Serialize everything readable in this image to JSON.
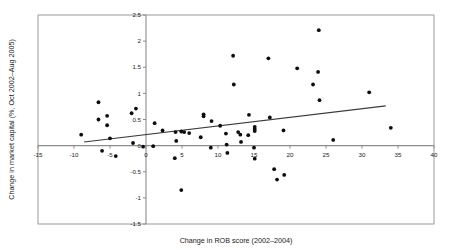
{
  "chart_data": {
    "type": "scatter",
    "title": "",
    "xlabel": "Change in ROB score (2002–2004)",
    "ylabel": "Change in market capital (%, Oct 2002–Aug 2005)",
    "xlim": [
      -15,
      40
    ],
    "ylim": [
      -1.5,
      2.5
    ],
    "xticks": [
      -15,
      -10,
      -5,
      0,
      5,
      10,
      15,
      20,
      25,
      30,
      35,
      40
    ],
    "xtick_labels": [
      "-15",
      "-10",
      "-5",
      "0",
      "5",
      "10",
      "15",
      "20",
      "25",
      "30",
      "35",
      "40"
    ],
    "yticks": [
      -1.5,
      -1,
      -0.5,
      0,
      0.5,
      1,
      1.5,
      2,
      2.5
    ],
    "ytick_labels": [
      "-1.5",
      "-1",
      "-0.5",
      "0",
      "0.5",
      "1",
      "1.5",
      "2",
      "2.5"
    ],
    "grid": false,
    "legend": null,
    "zero_lines": {
      "x": 0,
      "y": 0
    },
    "points": [
      [
        -9.0,
        0.21
      ],
      [
        -6.6,
        0.83
      ],
      [
        -6.6,
        0.5
      ],
      [
        -5.4,
        0.57
      ],
      [
        -5.4,
        0.39
      ],
      [
        -5.0,
        0.14
      ],
      [
        -6.1,
        -0.1
      ],
      [
        -4.2,
        -0.2
      ],
      [
        -2.0,
        0.62
      ],
      [
        -1.4,
        0.71
      ],
      [
        -1.8,
        0.05
      ],
      [
        -0.4,
        -0.02
      ],
      [
        1.2,
        0.43
      ],
      [
        1.0,
        -0.01
      ],
      [
        2.3,
        0.29
      ],
      [
        4.2,
        0.09
      ],
      [
        4.1,
        0.26
      ],
      [
        4.0,
        -0.24
      ],
      [
        4.9,
        0.27
      ],
      [
        5.3,
        0.26
      ],
      [
        4.9,
        -0.85
      ],
      [
        6.0,
        0.24
      ],
      [
        7.6,
        0.16
      ],
      [
        8.0,
        0.6
      ],
      [
        8.0,
        0.56
      ],
      [
        9.1,
        0.47
      ],
      [
        9.0,
        -0.04
      ],
      [
        10.3,
        0.38
      ],
      [
        11.1,
        0.23
      ],
      [
        11.2,
        0.02
      ],
      [
        11.3,
        -0.14
      ],
      [
        12.1,
        1.72
      ],
      [
        12.2,
        1.17
      ],
      [
        12.8,
        0.26
      ],
      [
        13.1,
        0.21
      ],
      [
        13.2,
        0.07
      ],
      [
        14.2,
        0.2
      ],
      [
        14.3,
        0.59
      ],
      [
        15.1,
        0.36
      ],
      [
        15.1,
        0.32
      ],
      [
        15.1,
        0.28
      ],
      [
        15.0,
        -0.04
      ],
      [
        15.1,
        -0.25
      ],
      [
        17.0,
        1.67
      ],
      [
        17.2,
        0.54
      ],
      [
        17.8,
        -0.45
      ],
      [
        18.2,
        -0.65
      ],
      [
        19.1,
        0.29
      ],
      [
        19.2,
        -0.56
      ],
      [
        21.0,
        1.48
      ],
      [
        23.2,
        1.17
      ],
      [
        23.9,
        1.41
      ],
      [
        24.0,
        2.21
      ],
      [
        24.1,
        0.87
      ],
      [
        26.0,
        0.11
      ],
      [
        31.0,
        1.02
      ],
      [
        34.0,
        0.34
      ]
    ],
    "trend_line": {
      "x_start": -8.6,
      "y_start": 0.07,
      "x_end": 33.3,
      "y_end": 0.76
    }
  }
}
